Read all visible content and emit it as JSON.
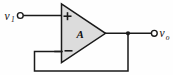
{
  "figure": {
    "name": "op-amp-voltage-follower",
    "type": "circuit-schematic",
    "background_color": "#fefefe"
  },
  "amplifier": {
    "gain_label": "A",
    "noninverting_symbol": "+",
    "inverting_symbol": "−",
    "body_fill_color": "#dcdcdc",
    "body_stroke_color": "#1a1a1a"
  },
  "inputs": {
    "source": {
      "label_main": "v",
      "label_sub": "1",
      "terminal": "open-circle"
    }
  },
  "outputs": {
    "node": {
      "label_main": "v",
      "label_sub": "o",
      "terminal": "open-circle"
    }
  },
  "nodes": {
    "output_junction": "filled-dot"
  },
  "wires": {
    "input_wire": "v1 terminal to noninverting input",
    "output_wire": "amplifier apex to vo terminal",
    "feedback_wire": "output junction down and around to inverting input"
  },
  "colors": {
    "wire": "#1a1a1a",
    "fill": "#dcdcdc",
    "text": "#111111"
  }
}
